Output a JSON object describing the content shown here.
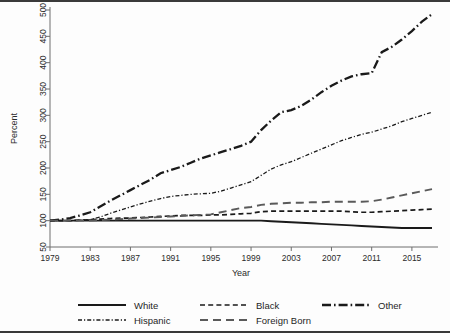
{
  "chart_data": {
    "type": "line",
    "title": "",
    "xlabel": "Year",
    "ylabel": "Percent",
    "xlim": [
      1979,
      2017
    ],
    "ylim": [
      50,
      500
    ],
    "grid": false,
    "legend_position": "bottom",
    "xticks": [
      "1979",
      "1983",
      "1987",
      "1991",
      "1995",
      "1999",
      "2003",
      "2007",
      "2011",
      "2015"
    ],
    "xtick_values": [
      1979,
      1983,
      1987,
      1991,
      1995,
      1999,
      2003,
      2007,
      2011,
      2015
    ],
    "yticks": [
      "50",
      "100",
      "150",
      "200",
      "250",
      "300",
      "350",
      "400",
      "450",
      "500"
    ],
    "ytick_values": [
      50,
      100,
      150,
      200,
      250,
      300,
      350,
      400,
      450,
      500
    ],
    "x": [
      1979,
      1980,
      1981,
      1982,
      1983,
      1984,
      1985,
      1986,
      1987,
      1988,
      1989,
      1990,
      1991,
      1992,
      1993,
      1994,
      1995,
      1996,
      1997,
      1998,
      1999,
      2000,
      2001,
      2002,
      2003,
      2004,
      2005,
      2006,
      2007,
      2008,
      2009,
      2010,
      2011,
      2012,
      2013,
      2014,
      2015,
      2016,
      2017
    ],
    "series": [
      {
        "name": "White",
        "style": "solid",
        "color": "#1a1a1a",
        "width": 1.9,
        "values": [
          100,
          100,
          100,
          100,
          100,
          100,
          100,
          100,
          100,
          100,
          100,
          100,
          100,
          100,
          100,
          100,
          100,
          100,
          100,
          100,
          100,
          100,
          99,
          98,
          97,
          96,
          95,
          94,
          93,
          92,
          91,
          90,
          89,
          88,
          87,
          86,
          86,
          86,
          86
        ]
      },
      {
        "name": "Black",
        "style": "dashed",
        "color": "#1a1a1a",
        "width": 1.7,
        "values": [
          100,
          100,
          100,
          101,
          102,
          103,
          104,
          105,
          105,
          106,
          107,
          108,
          109,
          110,
          110,
          110,
          111,
          111,
          112,
          113,
          114,
          117,
          118,
          118,
          118,
          118,
          118,
          118,
          118,
          118,
          117,
          116,
          116,
          117,
          118,
          119,
          120,
          121,
          122
        ]
      },
      {
        "name": "Other",
        "style": "dashdot",
        "color": "#1a1a1a",
        "width": 2.3,
        "values": [
          100,
          102,
          105,
          110,
          116,
          127,
          138,
          148,
          158,
          168,
          178,
          190,
          196,
          202,
          210,
          218,
          224,
          230,
          236,
          242,
          250,
          272,
          290,
          306,
          310,
          318,
          330,
          344,
          356,
          366,
          374,
          378,
          380,
          420,
          430,
          444,
          460,
          478,
          492
        ]
      },
      {
        "name": "Hispanic",
        "style": "dashdotdot",
        "color": "#1a1a1a",
        "width": 1.3,
        "values": [
          100,
          100,
          100,
          101,
          102,
          107,
          114,
          120,
          126,
          132,
          137,
          142,
          146,
          148,
          150,
          151,
          152,
          156,
          162,
          168,
          174,
          186,
          198,
          206,
          212,
          220,
          228,
          236,
          244,
          252,
          258,
          264,
          268,
          274,
          280,
          288,
          294,
          300,
          306
        ]
      },
      {
        "name": "Foreign Born",
        "style": "longdash",
        "color": "#5a5a5a",
        "width": 1.9,
        "values": [
          100,
          100,
          100,
          100,
          100,
          101,
          102,
          103,
          104,
          105,
          106,
          107,
          108,
          109,
          110,
          111,
          112,
          116,
          120,
          124,
          126,
          130,
          132,
          133,
          134,
          134,
          135,
          135,
          136,
          136,
          136,
          136,
          137,
          140,
          144,
          148,
          152,
          156,
          160
        ]
      }
    ],
    "legend_entries": [
      {
        "label": "White",
        "style": "solid"
      },
      {
        "label": "Black",
        "style": "dashed"
      },
      {
        "label": "Other",
        "style": "dashdot"
      },
      {
        "label": "Hispanic",
        "style": "dashdotdot"
      },
      {
        "label": "Foreign Born",
        "style": "longdash"
      }
    ]
  }
}
